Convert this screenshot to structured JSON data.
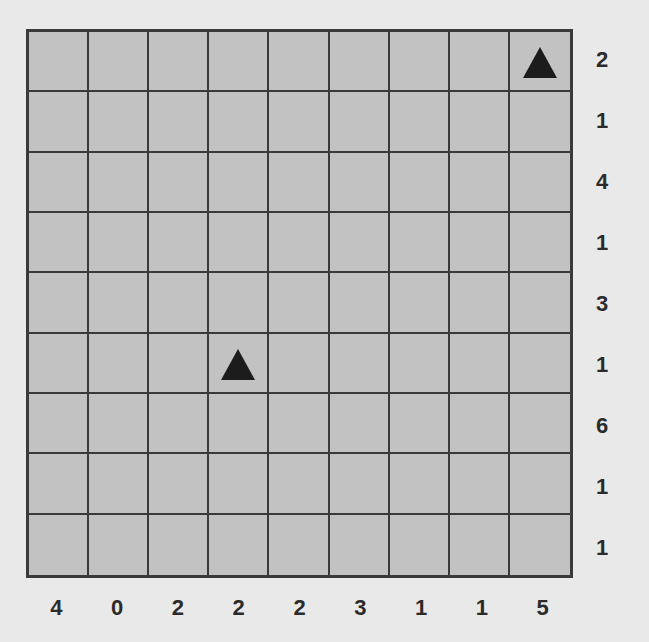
{
  "puzzle": {
    "rows": 9,
    "cols": 9,
    "row_clues": [
      "2",
      "1",
      "4",
      "1",
      "3",
      "1",
      "6",
      "1",
      "1"
    ],
    "col_clues": [
      "4",
      "0",
      "2",
      "2",
      "2",
      "3",
      "1",
      "1",
      "5"
    ],
    "triangles": [
      {
        "row": 0,
        "col": 8,
        "icon": "triangle-icon"
      },
      {
        "row": 5,
        "col": 3,
        "icon": "triangle-icon"
      }
    ],
    "colors": {
      "background": "#e9e9e9",
      "cell": "#c2c2c2",
      "grid_line": "#3a3a3a",
      "triangle": "#1c1c1c",
      "clue_text": "#2b2b2b"
    }
  }
}
